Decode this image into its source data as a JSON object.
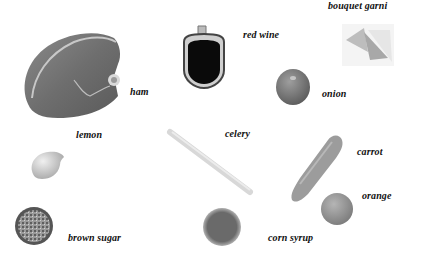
{
  "items": [
    {
      "id": "ham",
      "label": "ham"
    },
    {
      "id": "red-wine",
      "label": "red wine"
    },
    {
      "id": "bouquet-garni",
      "label": "bouquet garni"
    },
    {
      "id": "onion",
      "label": "onion"
    },
    {
      "id": "lemon",
      "label": "lemon"
    },
    {
      "id": "celery",
      "label": "celery"
    },
    {
      "id": "carrot",
      "label": "carrot"
    },
    {
      "id": "orange",
      "label": "orange"
    },
    {
      "id": "brown-sugar",
      "label": "brown sugar"
    },
    {
      "id": "corn-syrup",
      "label": "corn syrup"
    }
  ]
}
